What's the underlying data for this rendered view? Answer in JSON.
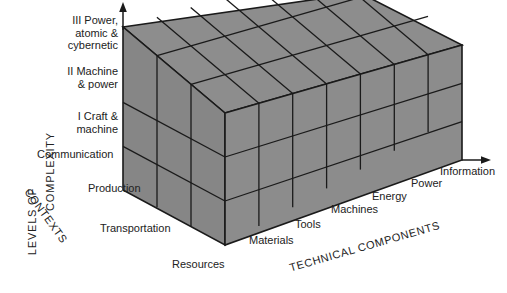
{
  "diagram": {
    "background_color": "#ffffff",
    "block_fill": "#8a8a8a",
    "block_edge_color": "#1a1a1a",
    "axes": {
      "vertical": {
        "name": "LEVELS OF COMPLEXITY",
        "line1": "LEVELS OF",
        "line2": "COMPLEXITY",
        "arrow": "up-arrow-icon",
        "levels": [
          {
            "numeral": "III",
            "label": "III Power,\natomic &\ncybernetic",
            "lines": [
              "III Power,",
              "atomic &",
              "cybernetic"
            ]
          },
          {
            "numeral": "II",
            "label": "II Machine\n& power",
            "lines": [
              "II Machine",
              "& power"
            ]
          },
          {
            "numeral": "I",
            "label": "I Craft &\nmachine",
            "lines": [
              "I Craft &",
              "machine"
            ]
          }
        ]
      },
      "depth": {
        "name": "CONTEXTS",
        "items": [
          "Communication",
          "Production",
          "Transportation"
        ]
      },
      "horizontal": {
        "name": "TECHNICAL COMPONENTS",
        "arrow": "right-arrow-icon",
        "items": [
          "Resources",
          "Materials",
          "Tools",
          "Machines",
          "Energy",
          "Power",
          "Information"
        ]
      }
    },
    "grid": {
      "columns": 7,
      "rows": 3,
      "depth": 3
    }
  }
}
